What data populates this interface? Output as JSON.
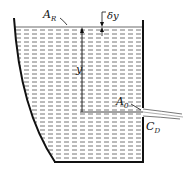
{
  "diagram": {
    "labels": {
      "surface_area": "A",
      "surface_area_sub": "R",
      "delta_y": "δy",
      "height": "y",
      "orifice_area": "A",
      "orifice_area_sub": "0",
      "discharge_coeff": "C",
      "discharge_coeff_sub": "D"
    },
    "colors": {
      "wall": "#111111",
      "water_dash": "#555555",
      "background": "#ffffff"
    }
  }
}
